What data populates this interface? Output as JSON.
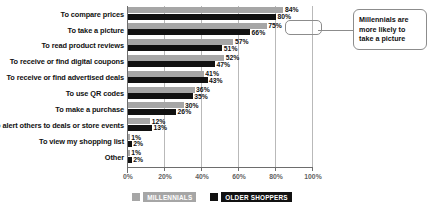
{
  "chart_data": {
    "type": "bar",
    "orientation": "horizontal",
    "title": "",
    "xlabel": "",
    "ylabel": "",
    "xlim": [
      0,
      100
    ],
    "xticks": [
      "0%",
      "20%",
      "40%",
      "60%",
      "80%",
      "100%"
    ],
    "xtick_values": [
      0,
      20,
      40,
      60,
      80,
      100
    ],
    "grid": true,
    "legend_position": "bottom",
    "categories": [
      "To compare prices",
      "To take a picture",
      "To read product reviews",
      "To receive or find digital coupons",
      "To receive or find advertised deals",
      "To use QR codes",
      "To make a purchase",
      "To alert others to deals or store events",
      "To view my shopping list",
      "Other"
    ],
    "series": [
      {
        "name": "MILLENNIALS",
        "color": "#a6a6a6",
        "values": [
          84,
          75,
          57,
          52,
          41,
          36,
          30,
          12,
          1,
          1
        ],
        "labels": [
          "84%",
          "75%",
          "57%",
          "52%",
          "41%",
          "36%",
          "30%",
          "12%",
          "1%",
          "1%"
        ]
      },
      {
        "name": "OLDER SHOPPERS",
        "color": "#111111",
        "values": [
          80,
          66,
          51,
          47,
          43,
          35,
          26,
          13,
          2,
          2
        ],
        "labels": [
          "80%",
          "66%",
          "51%",
          "47%",
          "43%",
          "35%",
          "26%",
          "13%",
          "2%",
          "2%"
        ]
      }
    ],
    "annotations": [
      {
        "text": "Millennials are more likely to take a picture",
        "target_category": "To take a picture",
        "target_series": "MILLENNIALS",
        "target_value": 75
      }
    ]
  },
  "legend": {
    "items": [
      {
        "label": "MILLENNIALS",
        "color": "#a6a6a6"
      },
      {
        "label": "OLDER SHOPPERS",
        "color": "#111111"
      }
    ]
  },
  "callout": {
    "text": "Millennials are more likely to take a picture"
  }
}
